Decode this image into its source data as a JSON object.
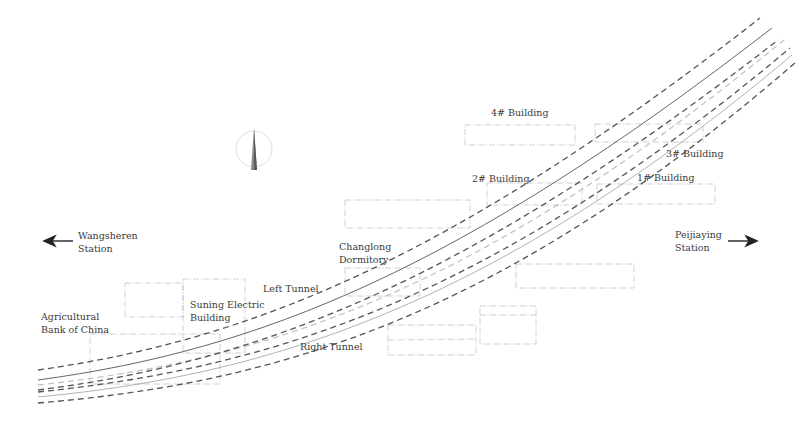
{
  "diagram": {
    "type": "tunnel-site-plan",
    "stations": {
      "left": {
        "line1": "Wangsheren",
        "line2": "Station",
        "direction": "left"
      },
      "right": {
        "line1": "Peijiaying",
        "line2": "Station",
        "direction": "right"
      }
    },
    "tunnels": {
      "left": "Left Tunnel",
      "right": "Right Tunnel"
    },
    "buildings": {
      "agricultural_bank": {
        "line1": "Agricultural",
        "line2": "Bank of China"
      },
      "suning": {
        "line1": "Suning Electric",
        "line2": "Building"
      },
      "changlong": {
        "line1": "Changlong",
        "line2": "Dormitory"
      },
      "b1": "1# Building",
      "b2": "2# Building",
      "b3": "3# Building",
      "b4": "4# Building"
    },
    "north_arrow": "north-arrow",
    "colors": {
      "tunnel_line": "#4a4a4a",
      "building_outline": "#bdbdbd",
      "text": "#3a3a3a"
    }
  }
}
